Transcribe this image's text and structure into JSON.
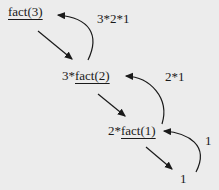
{
  "nodes": {
    "level3": {
      "prefix": "",
      "call": "fact(3)"
    },
    "level2": {
      "prefix": "3*",
      "call": "fact(2)"
    },
    "level1": {
      "prefix": "2*",
      "call": "fact(1)"
    },
    "base": "1"
  },
  "returns": {
    "to_level3": "3*2*1",
    "to_level2": "2*1",
    "to_level1": "1"
  }
}
